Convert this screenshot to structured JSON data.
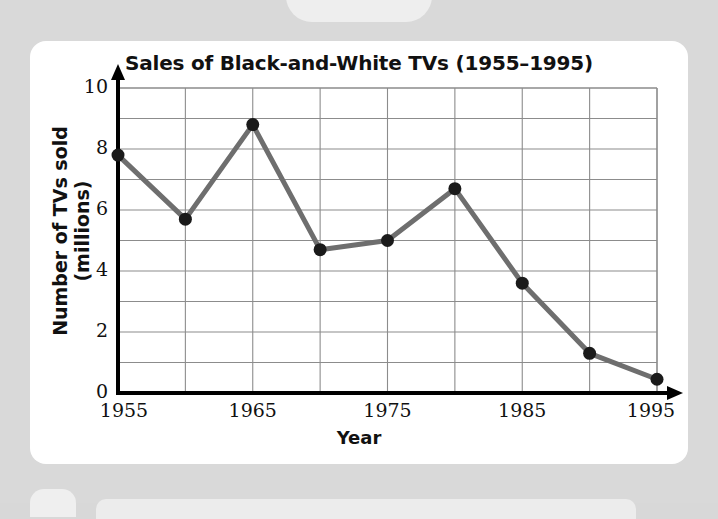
{
  "chart_data": {
    "type": "line",
    "title": "Sales of Black-and-White TVs (1955–1995)",
    "xlabel": "Year",
    "ylabel": "Number of TVs sold (millions)",
    "x": [
      1955,
      1960,
      1965,
      1970,
      1975,
      1980,
      1985,
      1990,
      1995
    ],
    "values": [
      7.8,
      5.7,
      8.8,
      4.7,
      5.0,
      6.7,
      3.6,
      1.3,
      0.45
    ],
    "series": [
      {
        "name": "Black-and-white TVs sold",
        "values": [
          7.8,
          5.7,
          8.8,
          4.7,
          5.0,
          6.7,
          3.6,
          1.3,
          0.45
        ]
      }
    ],
    "xlim": [
      1955,
      1995
    ],
    "ylim": [
      0,
      10
    ],
    "y_ticks": [
      0,
      2,
      4,
      6,
      8,
      10
    ],
    "y_tick_labels": [
      "0",
      "2",
      "4",
      "6",
      "8",
      "10"
    ],
    "y_minor_step": 1,
    "x_ticks": [
      1955,
      1965,
      1975,
      1985,
      1995
    ],
    "x_tick_labels": [
      "1955",
      "1965",
      "1975",
      "1985",
      "1995"
    ],
    "x_gridlines": [
      1955,
      1960,
      1965,
      1970,
      1975,
      1980,
      1985,
      1990,
      1995
    ],
    "grid": true,
    "legend": "none",
    "line_color": "#6e6e6e",
    "marker_color": "#1a1a1a",
    "axis_color": "#000000",
    "grid_color": "#8c8c8c",
    "background": "#ffffff",
    "page_background": "#d9d9d9"
  }
}
